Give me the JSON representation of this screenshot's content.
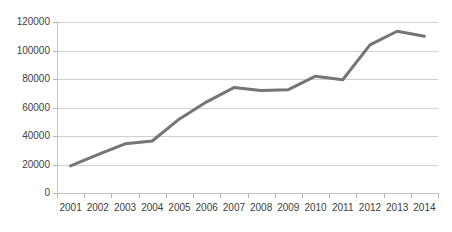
{
  "chart_data": {
    "type": "line",
    "title": "",
    "subtitle": "",
    "xlabel": "",
    "ylabel": "",
    "categories": [
      "2001",
      "2002",
      "2003",
      "2004",
      "2005",
      "2006",
      "2007",
      "2008",
      "2009",
      "2010",
      "2011",
      "2012",
      "2013",
      "2014"
    ],
    "series": [
      {
        "name": "Series 1",
        "color": "#757575",
        "values": [
          19000,
          27000,
          34500,
          36500,
          52000,
          64000,
          74000,
          72000,
          72500,
          82000,
          79500,
          104000,
          113500,
          110000
        ]
      }
    ],
    "ylim": [
      0,
      120000
    ],
    "yticks": [
      0,
      20000,
      40000,
      60000,
      80000,
      100000,
      120000
    ],
    "ytick_labels": [
      "0",
      "20000",
      "40000",
      "60000",
      "80000",
      "100000",
      "120000"
    ],
    "grid": true,
    "grid_axis": "y",
    "legend": false,
    "legend_position": "none",
    "markers": false,
    "line_width": 3
  },
  "colors": {
    "background": "#ffffff",
    "gridline": "#d0d0d0",
    "axis": "#c4c4c4",
    "text": "#404040",
    "series": "#757575"
  }
}
